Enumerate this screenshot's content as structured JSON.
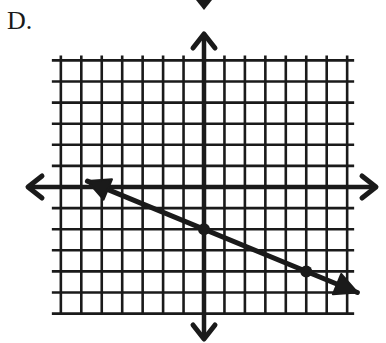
{
  "problem": {
    "label": "D."
  },
  "chart_data": {
    "type": "line",
    "title": "",
    "xlabel": "",
    "ylabel": "",
    "grid": true,
    "xlim": [
      -7,
      7
    ],
    "ylim": [
      -6,
      6
    ],
    "axes": {
      "x_arrows": true,
      "y_arrows": true,
      "tick_labels": false
    },
    "series": [
      {
        "name": "line",
        "slope": -0.4,
        "y_intercept": -2,
        "marked_points": [
          [
            0,
            -2
          ],
          [
            5,
            -4
          ]
        ],
        "arrow_ends": true,
        "visible_range_x": [
          -5.7,
          7.5
        ]
      }
    ]
  },
  "colors": {
    "ink": "#1a1a1a",
    "background": "#ffffff"
  }
}
